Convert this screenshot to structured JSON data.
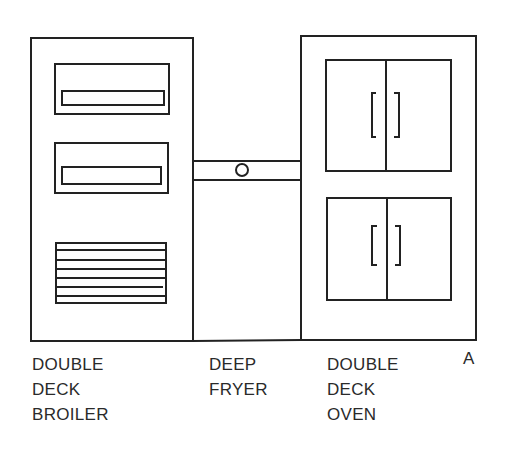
{
  "diagram": {
    "stroke_color": "#222222",
    "background": "#ffffff",
    "figure_letter": "A"
  },
  "equipment": [
    {
      "id": "broiler",
      "lines": [
        "DOUBLE",
        "DECK",
        "BROILER"
      ]
    },
    {
      "id": "fryer",
      "lines": [
        "DEEP",
        "FRYER"
      ]
    },
    {
      "id": "oven",
      "lines": [
        "DOUBLE",
        "DECK",
        "OVEN"
      ]
    }
  ]
}
